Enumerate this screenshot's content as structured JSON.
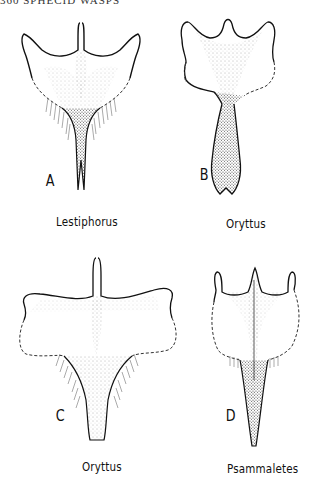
{
  "header": {
    "running_head": "360  SPHECID  WASPS"
  },
  "figure": {
    "panels": [
      {
        "letter": "A",
        "genus": "Lestiphorus"
      },
      {
        "letter": "B",
        "genus": "Oryttus"
      },
      {
        "letter": "C",
        "genus": "Oryttus"
      },
      {
        "letter": "D",
        "genus": "Psammaletes"
      }
    ]
  },
  "colors": {
    "ink": "#111111",
    "stipple": "#7a7a7a",
    "paper": "#ffffff"
  }
}
